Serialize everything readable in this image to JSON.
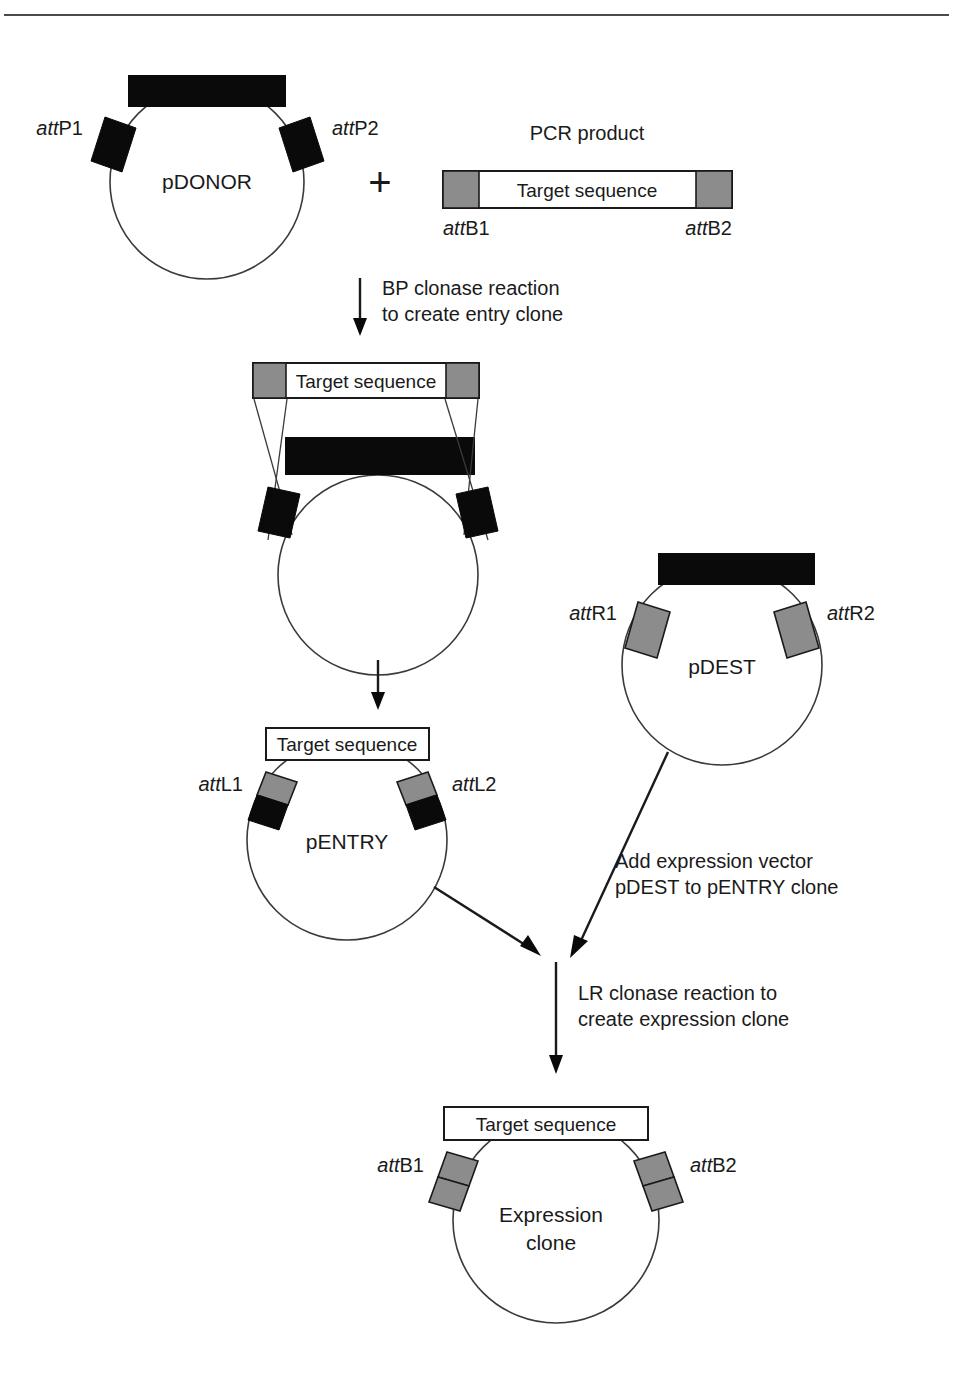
{
  "figure": {
    "top_rule": true,
    "colors": {
      "black": "#0a0a0a",
      "gray": "#8c8c8c",
      "line": "#3a3a3a",
      "white": "#ffffff"
    }
  },
  "stage1": {
    "donor": {
      "name": "pDONOR",
      "att_left": {
        "italic": "att",
        "rest": "P1"
      },
      "att_right": {
        "italic": "att",
        "rest": "P2"
      },
      "att_left_full": "attP1",
      "att_right_full": "attP2",
      "marker_style": "black-bar"
    },
    "plus": "+",
    "pcr": {
      "title": "PCR product",
      "target_label": "Target sequence",
      "att_left": {
        "italic": "att",
        "rest": "B1"
      },
      "att_right": {
        "italic": "att",
        "rest": "B2"
      },
      "att_left_full": "attB1",
      "att_right_full": "attB2",
      "end_style": "gray"
    }
  },
  "step1": {
    "line1": "BP clonase reaction",
    "line2": "to create entry clone"
  },
  "stage2": {
    "target_label": "Target sequence",
    "description": "recombination intermediate: PCR product aligned over pDONOR with crossing strands",
    "end_style": "gray",
    "att_style": "black",
    "marker_style": "black-bar"
  },
  "stage3": {
    "entry": {
      "name": "pENTRY",
      "target_label": "Target sequence",
      "att_left": {
        "italic": "att",
        "rest": "L1"
      },
      "att_right": {
        "italic": "att",
        "rest": "L2"
      },
      "att_left_full": "attL1",
      "att_right_full": "attL2",
      "att_style": "gray-top-black-bottom"
    },
    "dest": {
      "name": "pDEST",
      "att_left": {
        "italic": "att",
        "rest": "R1"
      },
      "att_right": {
        "italic": "att",
        "rest": "R2"
      },
      "att_left_full": "attR1",
      "att_right_full": "attR2",
      "att_style": "gray",
      "marker_style": "black-bar"
    }
  },
  "step2": {
    "line1": "Add expression vector",
    "line2": "pDEST to pENTRY clone"
  },
  "step3": {
    "line1": "LR clonase reaction to",
    "line2": "create expression clone"
  },
  "stage4": {
    "name_line1": "Expression",
    "name_line2": "clone",
    "target_label": "Target sequence",
    "att_left": {
      "italic": "att",
      "rest": "B1"
    },
    "att_right": {
      "italic": "att",
      "rest": "B2"
    },
    "att_left_full": "attB1",
    "att_right_full": "attB2",
    "att_style": "gray-split"
  }
}
